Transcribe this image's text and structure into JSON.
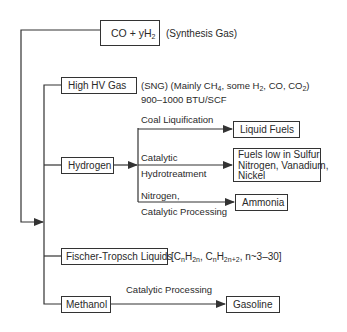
{
  "diagram": {
    "root": {
      "label_main": "CO + yH",
      "label_sub": "2",
      "annotation": "(Synthesis Gas)"
    },
    "high_hv_gas": {
      "label": "High HV Gas",
      "annotation_line1_parts": [
        "(SNG) (Mainly CH",
        "4",
        ", some H",
        "2",
        ", CO, CO",
        "2",
        ")"
      ],
      "annotation_line2": "900–1000 BTU/SCF"
    },
    "hydrogen": {
      "label": "Hydrogen",
      "branches": [
        {
          "process": "Coal Liquification",
          "product": "Liquid Fuels"
        },
        {
          "process_line1": "Catalytic",
          "process_line2": "Hydrotreatment",
          "product_lines": [
            "Fuels low in Sulfur",
            "Nitrogen, Vanadium,",
            "Nickel"
          ]
        },
        {
          "process_line1": "Nitrogen,",
          "process_line2": "Catalytic Processing",
          "product": "Ammonia"
        }
      ]
    },
    "fischer_tropsch": {
      "label": "Fischer-Tropsch Liquids",
      "formula_parts": [
        "[C",
        "n",
        "H",
        "2n",
        ", C",
        "n",
        "H",
        "2n+2",
        ", n~3–30]"
      ]
    },
    "methanol": {
      "label": "Methanol",
      "process": "Catalytic Processing",
      "product": "Gasoline"
    },
    "line_color": "#333333"
  }
}
